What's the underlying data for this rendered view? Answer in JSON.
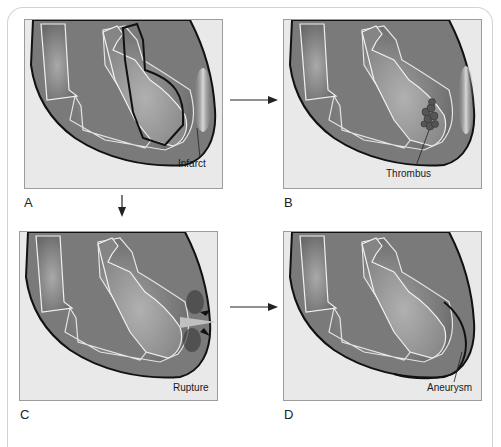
{
  "figure": {
    "panels": [
      {
        "id": "A",
        "letter": "A",
        "callout": "Infarct"
      },
      {
        "id": "B",
        "letter": "B",
        "callout": "Thrombus"
      },
      {
        "id": "C",
        "letter": "C",
        "callout": "Rupture"
      },
      {
        "id": "D",
        "letter": "D",
        "callout": "Aneurysm"
      }
    ],
    "arrows": [
      {
        "from": "A",
        "to": "B",
        "direction": "right"
      },
      {
        "from": "A",
        "to": "C",
        "direction": "down"
      },
      {
        "from": "C",
        "to": "D",
        "direction": "right"
      }
    ],
    "colors": {
      "panel_bg": "#e9e9e9",
      "heart_dark": "#6e6e6e",
      "heart_mid": "#8c8c8c",
      "heart_light": "#a6a6a6",
      "outline": "#111111",
      "inner_line": "#f2f2f2"
    }
  }
}
